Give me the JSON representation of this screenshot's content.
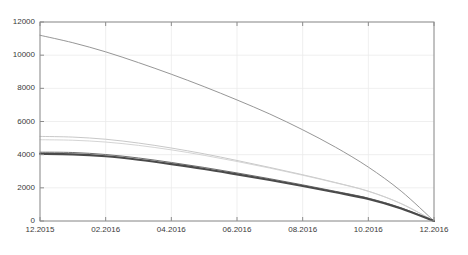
{
  "chart_data": {
    "type": "line",
    "title": "",
    "subtitle": "",
    "xlabel": "",
    "ylabel": "",
    "grid": true,
    "legend_position": "none",
    "xlim": [
      0,
      12
    ],
    "ylim": [
      0,
      12000
    ],
    "x": [
      0,
      1,
      2,
      3,
      4,
      5,
      6,
      7,
      8,
      9,
      10,
      11,
      12
    ],
    "xtick_positions": [
      0,
      2,
      4,
      6,
      8,
      10,
      12
    ],
    "xtick_labels": [
      "12.2015",
      "02.2016",
      "04.2016",
      "06.2016",
      "08.2016",
      "10.2016",
      "12.2016"
    ],
    "ytick_values": [
      0,
      2000,
      4000,
      6000,
      8000,
      10000,
      12000
    ],
    "ytick_labels": [
      "0",
      "2000",
      "4000",
      "6000",
      "8000",
      "10000",
      "12000"
    ],
    "series": [
      {
        "name": "series-1",
        "color": "#8a8a8a",
        "width": 0.9,
        "values": [
          11200,
          10750,
          10200,
          9550,
          8850,
          8100,
          7300,
          6450,
          5500,
          4450,
          3250,
          1800,
          0
        ]
      },
      {
        "name": "series-2",
        "color": "#c2c2c2",
        "width": 0.9,
        "values": [
          5100,
          5060,
          4930,
          4700,
          4400,
          4050,
          3650,
          3230,
          2790,
          2320,
          1800,
          1050,
          0
        ]
      },
      {
        "name": "series-3",
        "color": "#cfcfcf",
        "width": 0.9,
        "values": [
          4900,
          4870,
          4760,
          4560,
          4290,
          3960,
          3590,
          3190,
          2760,
          2300,
          1790,
          1040,
          0
        ]
      },
      {
        "name": "series-4",
        "color": "#6e6e6e",
        "width": 1.0,
        "values": [
          4150,
          4130,
          4010,
          3800,
          3530,
          3230,
          2900,
          2550,
          2180,
          1790,
          1380,
          790,
          0
        ]
      },
      {
        "name": "series-5",
        "color": "#4a4a4a",
        "width": 2.1,
        "values": [
          4050,
          4020,
          3900,
          3690,
          3430,
          3140,
          2810,
          2470,
          2110,
          1730,
          1330,
          760,
          0
        ]
      }
    ]
  },
  "axes": {
    "plot_left_px": 40,
    "plot_right_px": 434,
    "plot_top_px": 22,
    "plot_bottom_px": 221
  }
}
